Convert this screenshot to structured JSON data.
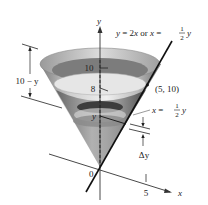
{
  "figure": {
    "equation_line": {
      "text_prefix": "y = 2x or x = ",
      "frac_num": "1",
      "frac_den": "2",
      "text_suffix": "y"
    },
    "axis_y_label": "y",
    "axis_x_label": "x",
    "origin_label": "0",
    "y_tick_10": "10",
    "y_tick_8": "8",
    "y_level_label": "y",
    "x_tick_5": "5",
    "point_label": "(5, 10)",
    "radius_label": {
      "prefix": "x = ",
      "frac_num": "1",
      "frac_den": "2",
      "suffix": "y"
    },
    "height_label": "10 − y",
    "delta_label": "Δy"
  },
  "colors": {
    "axis": "#333333",
    "line": "#111111",
    "cone_light": "#e8e8e8",
    "cone_mid": "#b8b8b8",
    "cone_dark": "#555555",
    "water_surface": "#d9d9d9",
    "slab": "#6a6a6a"
  }
}
